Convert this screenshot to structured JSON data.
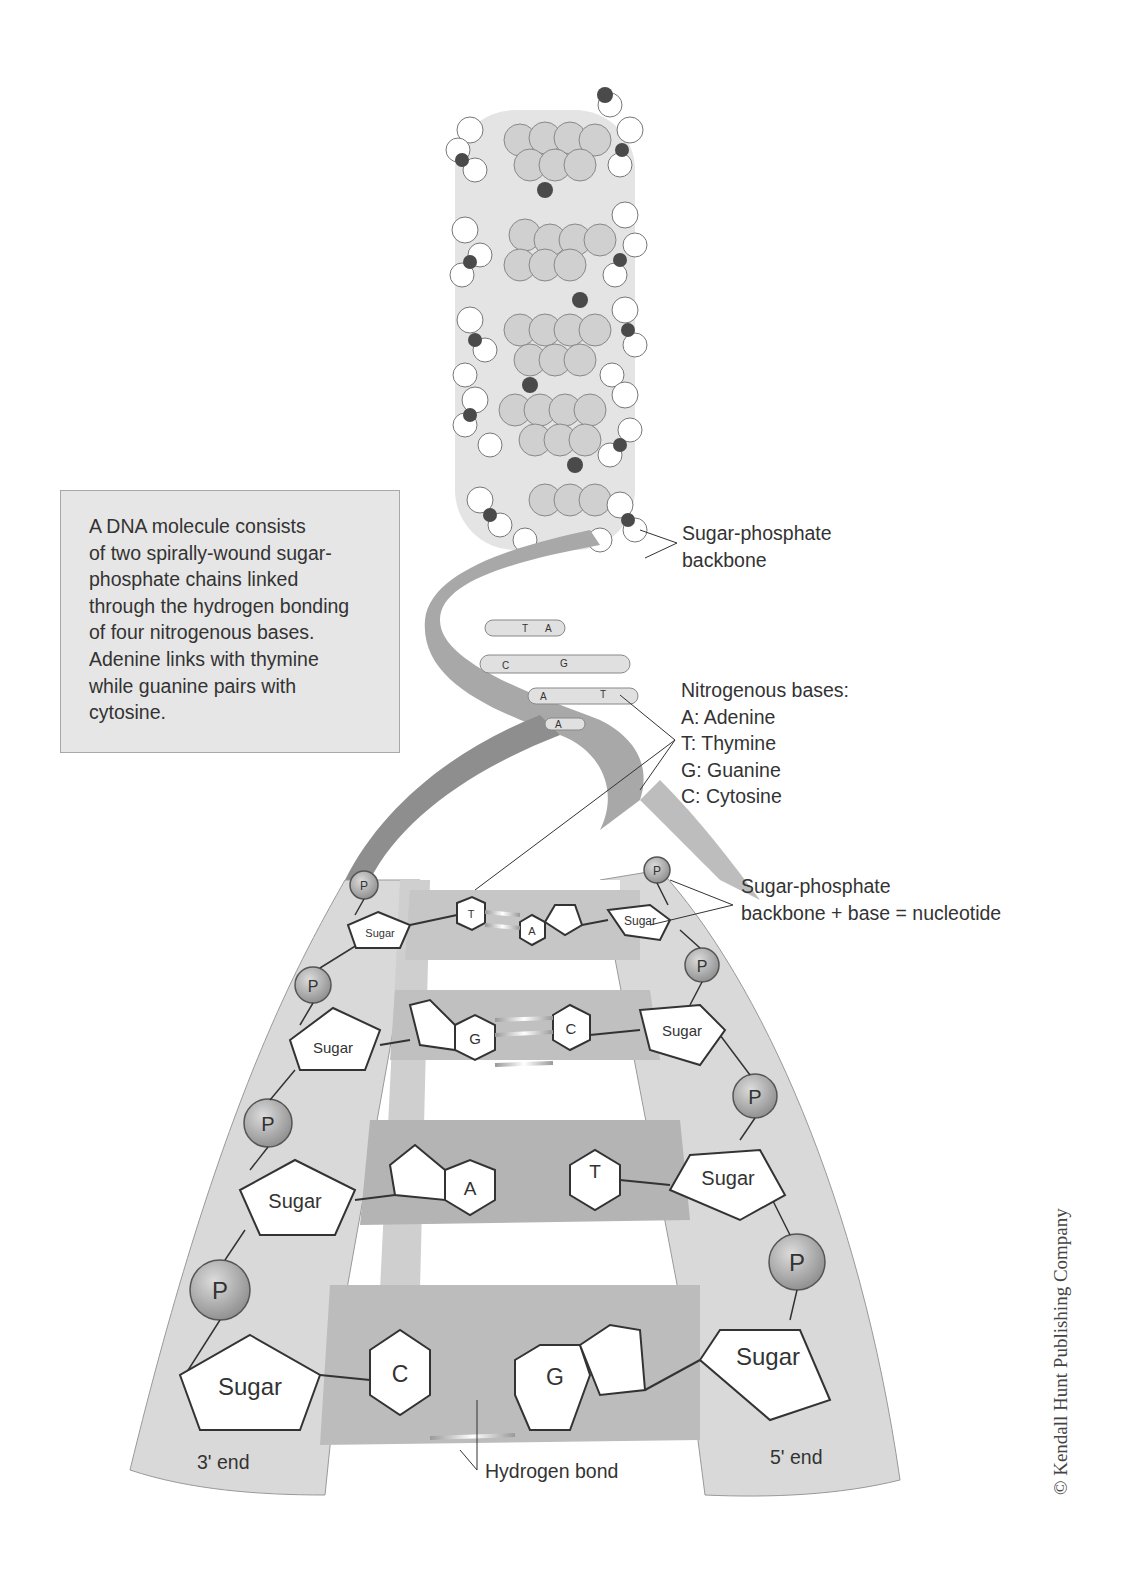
{
  "info_box": {
    "lines": [
      "A DNA molecule consists",
      "of two spirally-wound sugar-",
      "phosphate chains linked",
      "through the hydrogen bonding",
      "of four nitrogenous bases.",
      "Adenine links with thymine",
      "while guanine pairs with",
      "cytosine."
    ]
  },
  "labels": {
    "backbone": [
      "Sugar-phosphate",
      "backbone"
    ],
    "bases_title": "Nitrogenous bases:",
    "bases": [
      "A: Adenine",
      "T: Thymine",
      "G: Guanine",
      "C: Cytosine"
    ],
    "nucleotide": [
      "Sugar-phosphate",
      "backbone + base = nucleotide"
    ],
    "hydrogen_bond": "Hydrogen bond",
    "end_3": "3' end",
    "end_5": "5' end"
  },
  "helix_pairs": [
    {
      "left": "T",
      "right": "A"
    },
    {
      "left": "C",
      "right": "G"
    },
    {
      "left": "A",
      "right": "T"
    },
    {
      "left": "A",
      "right": ""
    }
  ],
  "ladder": {
    "phosphate_label": "P",
    "sugar_label": "Sugar",
    "rungs": [
      {
        "left_base": "T",
        "right_base": "A"
      },
      {
        "left_base": "G",
        "right_base": "C"
      },
      {
        "left_base": "A",
        "right_base": "T"
      },
      {
        "left_base": "C",
        "right_base": "G"
      }
    ]
  },
  "copyright": "© Kendall Hunt Publishing Company",
  "colors": {
    "ribbon": "#9a9a9a",
    "ribbon_light": "#d2d2d2",
    "phosphate": "#a9a9a9",
    "box_bg": "#e6e6e6"
  }
}
